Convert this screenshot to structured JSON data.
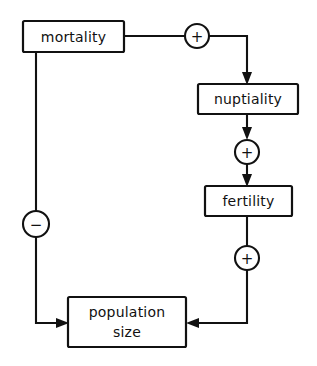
{
  "diagram": {
    "background_color": "#ffffff",
    "line_color": "#111111",
    "nodes": [
      {
        "id": "mortality",
        "label": "mortality",
        "shape": "box"
      },
      {
        "id": "nuptiality",
        "label": "nuptiality",
        "shape": "box"
      },
      {
        "id": "fertility",
        "label": "fertility",
        "shape": "box"
      },
      {
        "id": "population_size",
        "label_line1": "population",
        "label_line2": "size",
        "shape": "box"
      }
    ],
    "operators": [
      {
        "id": "plus_mortality_nuptiality",
        "label": "+",
        "shape": "circle"
      },
      {
        "id": "plus_nuptiality_fertility",
        "label": "+",
        "shape": "circle"
      },
      {
        "id": "plus_fertility_population",
        "label": "+",
        "shape": "circle"
      },
      {
        "id": "minus_mortality_population",
        "label": "−",
        "shape": "circle"
      }
    ],
    "edges": [
      {
        "from": "mortality",
        "to": "nuptiality",
        "sign": "+"
      },
      {
        "from": "nuptiality",
        "to": "fertility",
        "sign": "+"
      },
      {
        "from": "fertility",
        "to": "population_size",
        "sign": "+"
      },
      {
        "from": "mortality",
        "to": "population_size",
        "sign": "−"
      }
    ]
  }
}
